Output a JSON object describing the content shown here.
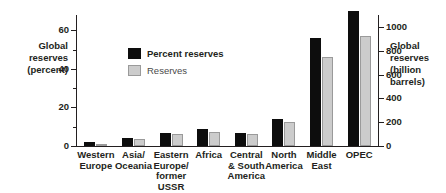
{
  "chart_data": {
    "type": "bar",
    "title": "",
    "subtitle": "",
    "categories": [
      "Western Europe",
      "Asia/ Oceania",
      "Eastern Europe/ former USSR",
      "Africa",
      "Central & South America",
      "North America",
      "Middle East",
      "OPEC"
    ],
    "series": [
      {
        "name": "Percent reserves",
        "color": "#0d0d0d",
        "axis": "left",
        "unit": "percent",
        "values": [
          2,
          4,
          7,
          9,
          7,
          14,
          56,
          70
        ]
      },
      {
        "name": "Reserves",
        "color": "#cccccc",
        "axis": "right",
        "unit": "billion barrels",
        "values": [
          20,
          55,
          105,
          120,
          100,
          205,
          745,
          920
        ]
      }
    ],
    "xlabel": "",
    "ylabel": "Global reserves (percent)",
    "ylabel_right": "Global reserves (billion barrels)",
    "ylim": [
      0,
      68
    ],
    "ylim_right": [
      0,
      1100
    ],
    "yticks": [
      0,
      20,
      40,
      60
    ],
    "yticks_minor": [
      10,
      30,
      50
    ],
    "yticks_right": [
      0,
      200,
      400,
      600,
      800,
      1000
    ],
    "grid": false,
    "legend_position": "inside-upper-left"
  },
  "axes": {
    "left_title": "Global reserves (percent)",
    "left_title_lines": [
      "Global",
      "reserves",
      "(percent)"
    ],
    "right_title": "Global reserves (billion barrels)",
    "right_title_lines": [
      "Global",
      "reserves",
      "(billion",
      "barrels)"
    ],
    "left_ticklabels": [
      "60",
      "40",
      "20",
      "0"
    ],
    "right_ticklabels": [
      "1000",
      "800",
      "600",
      "400",
      "200",
      "0"
    ]
  },
  "legend": {
    "items": [
      {
        "label": "Percent reserves",
        "swatch": "dark"
      },
      {
        "label": "Reserves",
        "swatch": "light"
      }
    ]
  },
  "categories_display": [
    {
      "lines": [
        "Western",
        "Europe"
      ]
    },
    {
      "lines": [
        "Asia/",
        "Oceania"
      ]
    },
    {
      "lines": [
        "Eastern",
        "Europe/",
        "former",
        "USSR"
      ]
    },
    {
      "lines": [
        "Africa"
      ]
    },
    {
      "lines": [
        "Central",
        "& South",
        "America"
      ]
    },
    {
      "lines": [
        "North",
        "America"
      ]
    },
    {
      "lines": [
        "Middle",
        "East"
      ]
    },
    {
      "lines": [
        "OPEC"
      ]
    }
  ]
}
